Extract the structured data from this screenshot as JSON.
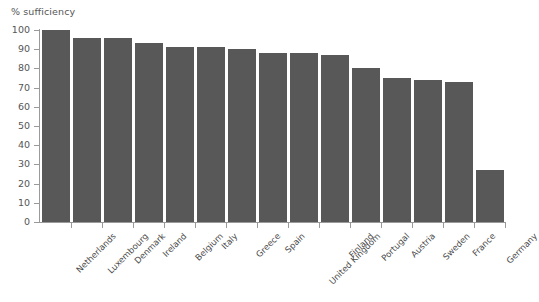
{
  "chart_data": {
    "type": "bar",
    "title": "",
    "subtitle": "",
    "ylabel": "% sufficiency",
    "xlabel": "",
    "ylim": [
      0,
      100
    ],
    "yticks": [
      0,
      10,
      20,
      30,
      40,
      50,
      60,
      70,
      80,
      90,
      100
    ],
    "grid": false,
    "legend": null,
    "bar_color": "#585858",
    "axis_color": "#9a9a9a",
    "categories": [
      "Netherlands",
      "Luxembourg",
      "Denmark",
      "Ireland",
      "Belgium",
      "Italy",
      "Greece",
      "Spain",
      "United Kingdom",
      "Finland",
      "Portugal",
      "Austria",
      "Sweden",
      "France",
      "Germany"
    ],
    "values": [
      100,
      96,
      96,
      93,
      91,
      91,
      90,
      88,
      88,
      87,
      80,
      75,
      74,
      73,
      27
    ]
  }
}
